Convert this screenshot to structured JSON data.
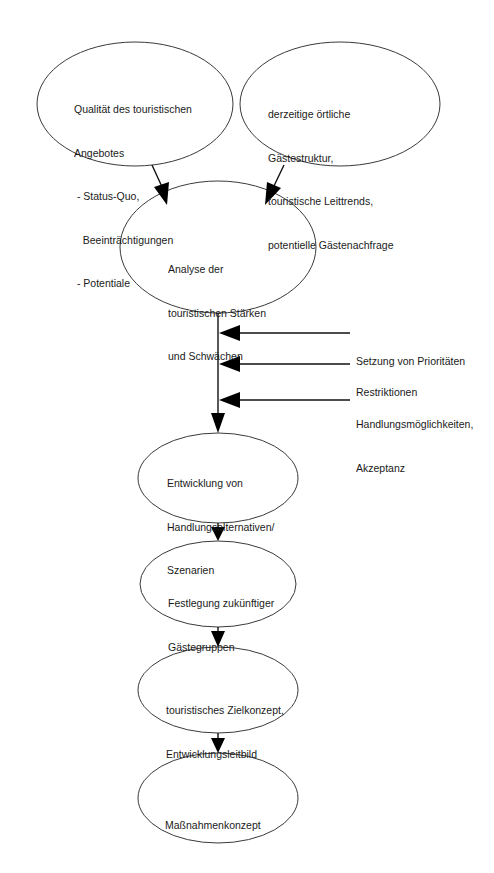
{
  "diagram": {
    "nodes": [
      {
        "id": "qualitaet",
        "lines": [
          "Qualität des touristischen",
          "Angebotes",
          " - Status-Quo,",
          "   Beeinträchtigungen",
          " - Potentiale"
        ]
      },
      {
        "id": "gaeste",
        "lines": [
          "derzeitige örtliche",
          "Gästestruktur,",
          "touristische Leittrends,",
          "potentielle Gästenachfrage"
        ]
      },
      {
        "id": "analyse",
        "lines": [
          "Analyse der",
          "touristischen Stärken",
          "und Schwächen"
        ]
      },
      {
        "id": "entwicklung",
        "lines": [
          "Entwicklung von",
          "Handlungsalternativen/",
          "Szenarien"
        ]
      },
      {
        "id": "festlegung",
        "lines": [
          "Festlegung zukünftiger",
          "Gästegruppen"
        ]
      },
      {
        "id": "zielkonzept",
        "lines": [
          "touristisches Zielkonzept,",
          "Entwicklungsleitbild"
        ]
      },
      {
        "id": "massnahmen",
        "lines": [
          "Maßnahmenkonzept"
        ]
      }
    ],
    "side_inputs": [
      {
        "id": "prioritaeten",
        "lines": [
          "Setzung von Prioritäten"
        ]
      },
      {
        "id": "restriktionen",
        "lines": [
          "Restriktionen"
        ]
      },
      {
        "id": "handlung",
        "lines": [
          "Handlungsmöglichkeiten,",
          "Akzeptanz"
        ]
      }
    ],
    "edges": [
      {
        "from": "qualitaet",
        "to": "analyse"
      },
      {
        "from": "gaeste",
        "to": "analyse"
      },
      {
        "from": "analyse",
        "to": "entwicklung"
      },
      {
        "from": "prioritaeten",
        "to": "analyse-entwicklung-line"
      },
      {
        "from": "restriktionen",
        "to": "analyse-entwicklung-line"
      },
      {
        "from": "handlung",
        "to": "analyse-entwicklung-line"
      },
      {
        "from": "entwicklung",
        "to": "festlegung"
      },
      {
        "from": "festlegung",
        "to": "zielkonzept"
      },
      {
        "from": "zielkonzept",
        "to": "massnahmen"
      }
    ],
    "colors": {
      "stroke": "#3a3a3a",
      "arrow": "#000000",
      "background": "#ffffff",
      "text": "#1a1a1a"
    }
  }
}
